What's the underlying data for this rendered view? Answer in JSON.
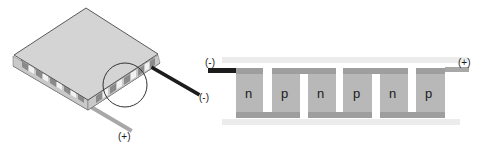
{
  "figure": {
    "left_module": {
      "description": "Isometric thermoelectric (Peltier) module",
      "negative_terminal_label": "(-)",
      "positive_terminal_label": "(+)",
      "colors": {
        "plate": "#d6d6d6",
        "plate_edge": "#555555",
        "negative_wire": "#1c1c1c",
        "positive_wire": "#a8a8a8",
        "highlight_circle": "#333333"
      }
    },
    "right_schematic": {
      "description": "Cross-section of alternating n/p semiconductor legs connected in series",
      "negative_terminal_label": "(-)",
      "positive_terminal_label": "(+)",
      "legs": [
        {
          "type": "n",
          "label": "n"
        },
        {
          "type": "p",
          "label": "p"
        },
        {
          "type": "n",
          "label": "n"
        },
        {
          "type": "p",
          "label": "p"
        },
        {
          "type": "n",
          "label": "n"
        },
        {
          "type": "p",
          "label": "p"
        }
      ],
      "colors": {
        "ceramic_plate": "#ececec",
        "conductor": "#9e9e9e",
        "leg": "#b8b8b8",
        "negative_wire": "#1c1c1c",
        "positive_wire": "#a8a8a8"
      }
    }
  }
}
